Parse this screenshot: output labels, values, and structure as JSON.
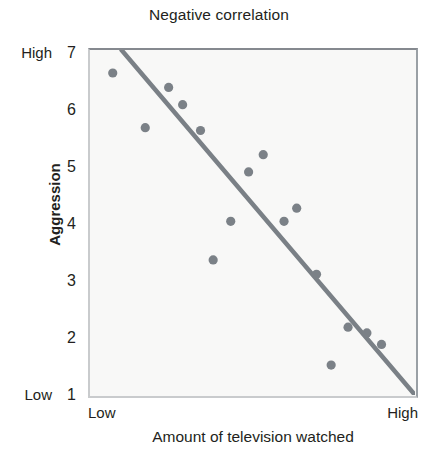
{
  "chart_data": {
    "type": "scatter",
    "title": "Negative correlation",
    "xlabel": "Amount of television watched",
    "ylabel": "Aggression",
    "grid": false,
    "legend": null,
    "xlim": [
      0,
      10
    ],
    "ylim": [
      1,
      7
    ],
    "x_tick_labels": [
      "Low",
      "High"
    ],
    "y_tick_labels": [
      "7",
      "6",
      "5",
      "4",
      "3",
      "2",
      "1"
    ],
    "y_extreme_labels": {
      "top": "High",
      "bottom": "Low"
    },
    "y_ticks": [
      7,
      6,
      5,
      4,
      3,
      2,
      1
    ],
    "point_color": "#7b8187",
    "line_color": "#7a8086",
    "frame_color": "#8d9297",
    "plot_background": "#f8f8f7",
    "text_color": "#231f20",
    "points": [
      {
        "x": 0.7,
        "y": 6.6
      },
      {
        "x": 2.42,
        "y": 6.35
      },
      {
        "x": 2.85,
        "y": 6.05
      },
      {
        "x": 1.7,
        "y": 5.65
      },
      {
        "x": 3.4,
        "y": 5.6
      },
      {
        "x": 5.33,
        "y": 5.18
      },
      {
        "x": 4.88,
        "y": 4.88
      },
      {
        "x": 6.36,
        "y": 4.25
      },
      {
        "x": 5.97,
        "y": 4.02
      },
      {
        "x": 4.33,
        "y": 4.02
      },
      {
        "x": 3.79,
        "y": 3.35
      },
      {
        "x": 6.97,
        "y": 3.1
      },
      {
        "x": 7.94,
        "y": 2.18
      },
      {
        "x": 8.52,
        "y": 2.08
      },
      {
        "x": 8.97,
        "y": 1.88
      },
      {
        "x": 7.42,
        "y": 1.52
      }
    ],
    "trendline": {
      "x_start": 0.97,
      "y_start": 7.0,
      "x_end": 10.0,
      "y_end": 1.0,
      "description": "downward-sloping best-fit line"
    }
  }
}
